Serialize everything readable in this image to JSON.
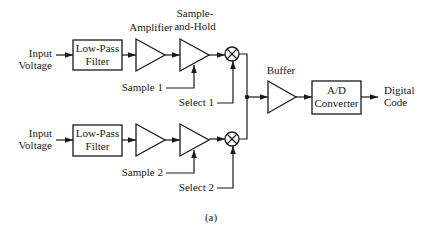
{
  "diagram": {
    "caption": "(a)",
    "channels": [
      {
        "input_label_line1": "Input",
        "input_label_line2": "Voltage",
        "filter_line1": "Low-Pass",
        "filter_line2": "Filter",
        "amplifier_label": "Amplifier",
        "sample_hold_line1": "Sample-",
        "sample_hold_line2": "and-Hold",
        "sample_control": "Sample 1",
        "select_control": "Select 1"
      },
      {
        "input_label_line1": "Input",
        "input_label_line2": "Voltage",
        "filter_line1": "Low-Pass",
        "filter_line2": "Filter",
        "sample_control": "Sample 2",
        "select_control": "Select 2"
      }
    ],
    "buffer_label": "Buffer",
    "adc_line1": "A/D",
    "adc_line2": "Converter",
    "output_line1": "Digital",
    "output_line2": "Code"
  },
  "colors": {
    "line": "#1a1a1a",
    "background": "#ffffff"
  }
}
